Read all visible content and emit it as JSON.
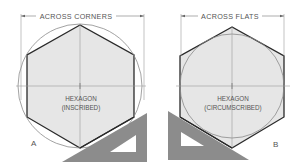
{
  "figure": {
    "panels": [
      {
        "id": "A",
        "label": "A",
        "dimension_label": "ACROSS CORNERS",
        "shape_line1": "HEXAGON",
        "shape_line2": "(INSCRIBED)",
        "circle": {
          "cx": 80,
          "cy": 86,
          "r": 62
        },
        "hexagon_points": "80,25 27,55 27,117 80,148 134,117 134,55",
        "extension_lines": [
          {
            "x": 21,
            "y1": 14,
            "y2": 100
          },
          {
            "x": 144,
            "y1": 14,
            "y2": 100
          }
        ],
        "dimension_line_y": 16,
        "triangle": {
          "outer": "62,162 147,113 147,162",
          "inner": "108,152 136,134 136,152"
        }
      },
      {
        "id": "B",
        "label": "B",
        "dimension_label": "ACROSS FLATS",
        "shape_line1": "HEXAGON",
        "shape_line2": "(CIRCUMSCRIBED)",
        "circle": {
          "cx": 232,
          "cy": 86,
          "r": 52
        },
        "hexagon_points": "232,27 180,56 180,117 232,148 284,117 284,56",
        "extension_lines": [
          {
            "x": 180,
            "y1": 14,
            "y2": 60
          },
          {
            "x": 285,
            "y1": 14,
            "y2": 60
          }
        ],
        "dimension_line_y": 16,
        "triangle": {
          "outer": "168,111 249,160 168,160",
          "inner": "180,132 205,146 180,146"
        }
      }
    ],
    "colors": {
      "hexagon_fill": "#e6e6e6",
      "hexagon_stroke": "#2a2a2a",
      "circle_stroke": "#8a8a8a",
      "construction_line": "#9a9a9a",
      "triangle_fill": "#8c8c8c",
      "text": "#555555"
    }
  }
}
